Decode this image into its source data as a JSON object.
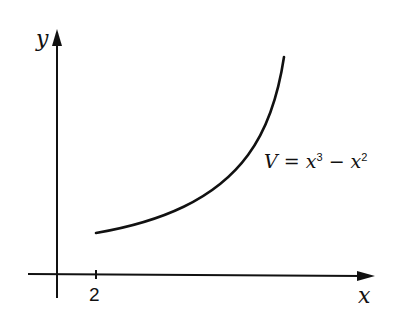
{
  "diagram": {
    "axes": {
      "x_label": "x",
      "y_label": "y",
      "x_tick": "2"
    },
    "curve": {
      "label_var": "V",
      "label_eq": "=",
      "label_term1": "x",
      "label_exp1": "3",
      "label_minus": "−",
      "label_term2": "x",
      "label_exp2": "2",
      "equation": "V = x³ − x²",
      "domain_start": 2
    },
    "colors": {
      "stroke": "#111111",
      "background": "#ffffff"
    }
  }
}
